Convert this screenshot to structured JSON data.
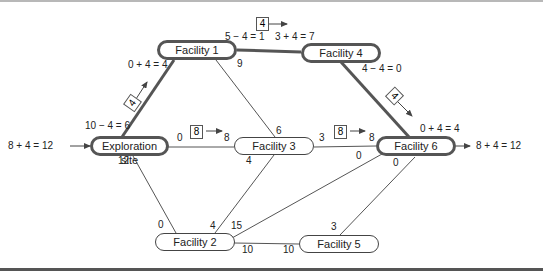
{
  "diagram": {
    "type": "network-flow",
    "nodes": [
      {
        "id": "exploration",
        "label": "Exploration site",
        "bold": true
      },
      {
        "id": "f1",
        "label": "Facility 1",
        "bold": true
      },
      {
        "id": "f2",
        "label": "Facility 2",
        "bold": false
      },
      {
        "id": "f3",
        "label": "Facility 3",
        "bold": false
      },
      {
        "id": "f4",
        "label": "Facility 4",
        "bold": true
      },
      {
        "id": "f5",
        "label": "Facility 5",
        "bold": false
      },
      {
        "id": "f6",
        "label": "Facility 6",
        "bold": true
      }
    ],
    "edges": [
      {
        "from": "exploration",
        "to": "f1",
        "bold": true,
        "label_from": "10 − 4 = 6",
        "label_to": "0 + 4 = 4",
        "flow_box": "4"
      },
      {
        "from": "exploration",
        "to": "f3",
        "bold": false,
        "label_from": "0",
        "label_to": "8",
        "flow_box": "8"
      },
      {
        "from": "exploration",
        "to": "f2",
        "bold": false,
        "label_from": "12",
        "label_to": "0"
      },
      {
        "from": "f1",
        "to": "f4",
        "bold": true,
        "label_from": "5 − 4 = 1",
        "label_to": "3 + 4 = 7",
        "flow_box": "4"
      },
      {
        "from": "f1",
        "to": "f3",
        "bold": false,
        "label_from": "9",
        "label_to": "6"
      },
      {
        "from": "f4",
        "to": "f6",
        "bold": true,
        "label_from": "4 − 4 = 0",
        "label_to": "0 + 4 = 4",
        "flow_box": "4"
      },
      {
        "from": "f3",
        "to": "f6",
        "bold": false,
        "label_from": "3",
        "label_to": "8",
        "flow_box": "8"
      },
      {
        "from": "f3",
        "to": "f2",
        "bold": false,
        "label_from": "4",
        "label_to": "4"
      },
      {
        "from": "f2",
        "to": "f6",
        "bold": false,
        "label_from": "15",
        "label_to": "0"
      },
      {
        "from": "f2",
        "to": "f5",
        "bold": false,
        "label_from": "10",
        "label_to": "10"
      },
      {
        "from": "f5",
        "to": "f6",
        "bold": false,
        "label_from": "3",
        "label_to": "0"
      }
    ],
    "source_label": "8 + 4 = 12",
    "sink_label": "8 + 4 = 12"
  },
  "labels": {
    "in_flow": "8 + 4 = 12",
    "out_flow": "8 + 4 = 12",
    "ex_f1_from": "10 − 4 = 6",
    "ex_f1_to": "0 + 4 = 4",
    "ex_f1_box": "4",
    "ex_f3_from": "0",
    "ex_f3_to": "8",
    "ex_f3_box": "8",
    "ex_f2_from": "12",
    "ex_f2_to": "0",
    "f1_f4_from": "5 − 4 = 1",
    "f1_f4_to": "3 + 4 = 7",
    "f1_f4_box": "4",
    "f1_f3_from": "9",
    "f1_f3_to": "6",
    "f4_f6_from": "4 − 4 = 0",
    "f4_f6_to": "0 + 4 = 4",
    "f4_f6_box": "4",
    "f3_f6_from": "3",
    "f3_f6_to": "8",
    "f3_f6_box": "8",
    "f3_f2_from": "4",
    "f3_f2_to": "4",
    "f2_f6_from": "15",
    "f2_f6_to": "0",
    "f2_f5_from": "10",
    "f2_f5_to": "10",
    "f5_f6_from": "3",
    "f5_f6_to": "0"
  },
  "nodes": {
    "exploration": "Exploration site",
    "f1": "Facility 1",
    "f2": "Facility 2",
    "f3": "Facility 3",
    "f4": "Facility 4",
    "f5": "Facility 5",
    "f6": "Facility 6"
  }
}
